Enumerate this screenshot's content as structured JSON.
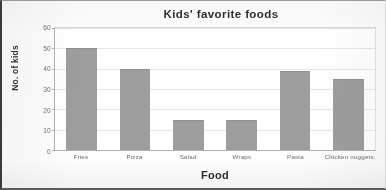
{
  "chart_data": {
    "type": "bar",
    "title": "Kids' favorite foods",
    "xlabel": "Food",
    "ylabel": "No. of kids",
    "categories": [
      "Fries",
      "Pizza",
      "Salad",
      "Wraps",
      "Pasta",
      "Chicken nuggets"
    ],
    "values": [
      50,
      40,
      15,
      15,
      39,
      35
    ],
    "ylim": [
      0,
      60
    ],
    "yticks": [
      0,
      10,
      20,
      30,
      40,
      50,
      60
    ],
    "ytick_labels": [
      "0",
      "10",
      "20",
      "30",
      "40",
      "50",
      "60"
    ],
    "grid": true,
    "legend": false,
    "series": [
      {
        "name": "No. of kids",
        "values": [
          50,
          40,
          15,
          15,
          39,
          35
        ]
      }
    ],
    "colors": {
      "bar": "#9d9d9d",
      "gridline": "#e6e6e6",
      "axis": "#b0b0b0",
      "text": "#2e2e2e",
      "tick_text": "#6a6a6a",
      "plot_background": "#ffffff",
      "figure_background": "#fdfdfd",
      "frame": "#3a3a3a"
    }
  }
}
